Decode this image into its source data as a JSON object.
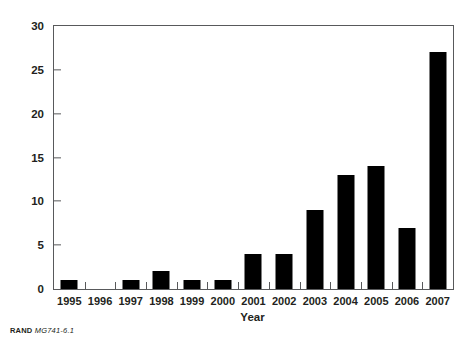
{
  "chart_data": {
    "type": "bar",
    "title": "",
    "xlabel": "Year",
    "ylabel": "Al Qa'ida attacks",
    "categories": [
      "1995",
      "1996",
      "1997",
      "1998",
      "1999",
      "2000",
      "2001",
      "2002",
      "2003",
      "2004",
      "2005",
      "2006",
      "2007"
    ],
    "values": [
      1,
      0,
      1,
      2,
      1,
      1,
      4,
      4,
      9,
      13,
      14,
      7,
      27
    ],
    "ylim": [
      0,
      30
    ],
    "yticks": [
      0,
      5,
      10,
      15,
      20,
      25,
      30
    ],
    "ytick_labels": [
      "0",
      "5",
      "10",
      "15",
      "20",
      "25",
      "30"
    ],
    "grid": false,
    "legend": false,
    "bar_color": "#000000",
    "frame_color": "#58595b",
    "background_color": "#ffffff"
  },
  "source_note": {
    "brand": "RAND",
    "doc_id": "MG741-6.1"
  }
}
